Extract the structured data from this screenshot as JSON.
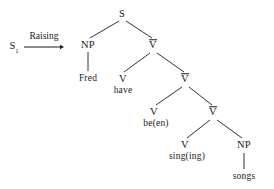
{
  "figure": {
    "type": "syntax-tree",
    "title_text": "",
    "background_color": "#ffffff",
    "ink_color": "#1a1a1a"
  },
  "transformation": {
    "source_label": "S",
    "source_subscript": "1",
    "arrow_label": "Raising",
    "arrow_icon": "right-arrow-icon",
    "arrow": {
      "x1": 24,
      "y1": 47,
      "x2": 64,
      "y2": 47
    },
    "source_pos": {
      "x": 14,
      "y": 47
    },
    "label_pos": {
      "x": 44,
      "y": 36
    }
  },
  "tree": {
    "nodes": [
      {
        "id": "s",
        "label": "S",
        "barred": false,
        "kind": "cat",
        "x": 122,
        "y": 14
      },
      {
        "id": "np1",
        "label": "NP",
        "barred": false,
        "kind": "cat",
        "x": 88,
        "y": 45
      },
      {
        "id": "fred",
        "label": "Fred",
        "barred": false,
        "kind": "leaf",
        "x": 88,
        "y": 79
      },
      {
        "id": "vbar1",
        "label": "V",
        "barred": true,
        "kind": "cat",
        "x": 153,
        "y": 45
      },
      {
        "id": "v1",
        "label": "V",
        "barred": false,
        "kind": "cat",
        "x": 123,
        "y": 79
      },
      {
        "id": "have",
        "label": "have",
        "barred": false,
        "kind": "leaf",
        "x": 123,
        "y": 91
      },
      {
        "id": "vbar2",
        "label": "V",
        "barred": true,
        "kind": "cat",
        "x": 185,
        "y": 79
      },
      {
        "id": "v2",
        "label": "V",
        "barred": false,
        "kind": "cat",
        "x": 154,
        "y": 112
      },
      {
        "id": "been",
        "label": "be(en)",
        "barred": false,
        "kind": "leaf",
        "x": 156,
        "y": 124
      },
      {
        "id": "vbar3",
        "label": "V",
        "barred": true,
        "kind": "cat",
        "x": 213,
        "y": 112
      },
      {
        "id": "v3",
        "label": "V",
        "barred": false,
        "kind": "cat",
        "x": 185,
        "y": 145
      },
      {
        "id": "singing",
        "label": "sing(ing)",
        "barred": false,
        "kind": "leaf",
        "x": 187,
        "y": 157
      },
      {
        "id": "np2",
        "label": "NP",
        "barred": false,
        "kind": "cat",
        "x": 244,
        "y": 145
      },
      {
        "id": "songs",
        "label": "songs",
        "barred": false,
        "kind": "leaf",
        "x": 244,
        "y": 177
      }
    ],
    "edges": [
      {
        "from": "s",
        "to": "np1",
        "x1": 119,
        "y1": 21,
        "x2": 90,
        "y2": 38
      },
      {
        "from": "s",
        "to": "vbar1",
        "x1": 126,
        "y1": 21,
        "x2": 152,
        "y2": 38
      },
      {
        "from": "np1",
        "to": "fred",
        "x1": 88,
        "y1": 52,
        "x2": 88,
        "y2": 71
      },
      {
        "from": "vbar1",
        "to": "v1",
        "x1": 150,
        "y1": 53,
        "x2": 124,
        "y2": 72
      },
      {
        "from": "vbar1",
        "to": "vbar2",
        "x1": 157,
        "y1": 53,
        "x2": 184,
        "y2": 72
      },
      {
        "from": "vbar2",
        "to": "v2",
        "x1": 182,
        "y1": 87,
        "x2": 156,
        "y2": 105
      },
      {
        "from": "vbar2",
        "to": "vbar3",
        "x1": 189,
        "y1": 87,
        "x2": 212,
        "y2": 105
      },
      {
        "from": "vbar3",
        "to": "v3",
        "x1": 210,
        "y1": 120,
        "x2": 187,
        "y2": 138
      },
      {
        "from": "vbar3",
        "to": "np2",
        "x1": 217,
        "y1": 120,
        "x2": 242,
        "y2": 138
      },
      {
        "from": "np2",
        "to": "songs",
        "x1": 244,
        "y1": 153,
        "x2": 244,
        "y2": 169
      }
    ]
  }
}
